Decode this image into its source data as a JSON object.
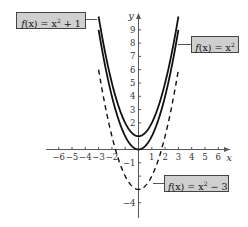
{
  "chart_data": {
    "type": "line",
    "title": "",
    "xlabel": "x",
    "ylabel": "y",
    "xlim": [
      -6.5,
      7
    ],
    "ylim": [
      -5,
      10
    ],
    "grid": false,
    "x_ticks": [
      -6,
      -5,
      -4,
      -3,
      -2,
      -1,
      1,
      2,
      3,
      4,
      5,
      6
    ],
    "x_tick_labels": [
      "−6",
      "−5",
      "−4",
      "−3",
      "−2",
      "",
      "1",
      "2",
      "3",
      "4",
      "5",
      "6"
    ],
    "y_ticks": [
      -4,
      -3,
      -2,
      -1,
      1,
      2,
      3,
      4,
      5,
      6,
      7,
      8,
      9
    ],
    "y_tick_labels": [
      "−4",
      "",
      "",
      "−1",
      "",
      "2",
      "3",
      "4",
      "5",
      "6",
      "7",
      "8",
      "9"
    ],
    "series": [
      {
        "name": "f(x) = x² + 1",
        "formula": "x^2 + 1",
        "domain": [
          -3,
          3
        ],
        "style": "solid",
        "color": "#111111"
      },
      {
        "name": "f(x) = x²",
        "formula": "x^2",
        "domain": [
          -3,
          3
        ],
        "style": "solid",
        "color": "#111111"
      },
      {
        "name": "f(x) = x² − 3",
        "formula": "x^2 - 3",
        "domain": [
          -3,
          3
        ],
        "style": "dashed",
        "color": "#111111"
      }
    ],
    "annotations": [
      {
        "text": "f(x) = x² + 1",
        "target_series": 0
      },
      {
        "text": "f(x) = x²",
        "target_series": 1
      },
      {
        "text": "f(x) = x² − 3",
        "target_series": 2
      }
    ]
  },
  "labels": {
    "x_axis": "x",
    "y_axis": "y",
    "parabola_shift_up": {
      "fx": "f",
      "arg": "(x)",
      "eq": " = x",
      "sup": "2",
      "tail": " + 1"
    },
    "parabola_base": {
      "fx": "f",
      "arg": "(x)",
      "eq": " = x",
      "sup": "2",
      "tail": ""
    },
    "parabola_shift_down": {
      "fx": "f",
      "arg": "(x)",
      "eq": " = x",
      "sup": "2",
      "tail": " − 3"
    }
  },
  "colors": {
    "axis": "#555555",
    "curve": "#111111",
    "label_bg": "#cfcfcf",
    "label_border": "#444444"
  }
}
